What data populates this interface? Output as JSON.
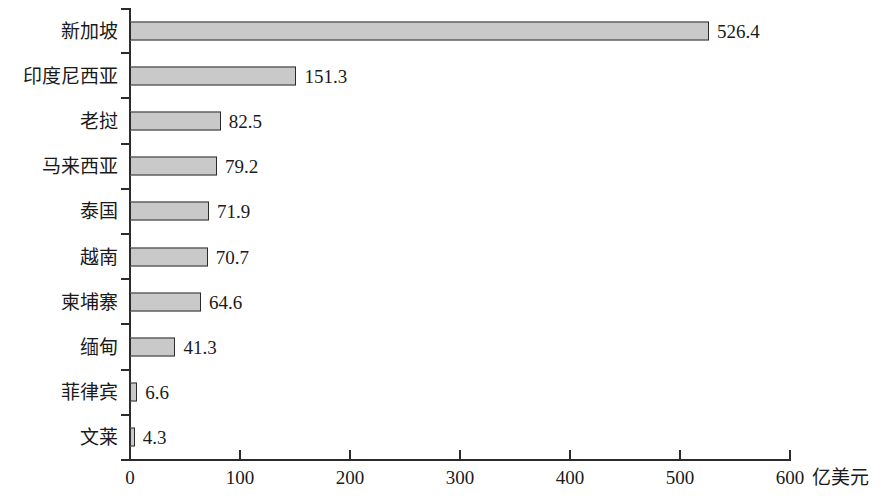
{
  "chart_data": {
    "type": "bar",
    "orientation": "horizontal",
    "title": "",
    "subtitle": "",
    "xlabel": "亿美元",
    "ylabel": "",
    "xlim": [
      0,
      600
    ],
    "xticks": [
      "0",
      "100",
      "200",
      "300",
      "400",
      "500",
      "600"
    ],
    "xtick_values": [
      0,
      100,
      200,
      300,
      400,
      500,
      600
    ],
    "grid": false,
    "legend": false,
    "categories": [
      "新加坡",
      "印度尼西亚",
      "老挝",
      "马来西亚",
      "泰国",
      "越南",
      "柬埔寨",
      "缅甸",
      "菲律宾",
      "文莱"
    ],
    "values": [
      526.4,
      151.3,
      82.5,
      79.2,
      71.9,
      70.7,
      64.6,
      41.3,
      6.6,
      4.3
    ],
    "data_labels": [
      "526.4",
      "151.3",
      "82.5",
      "79.2",
      "71.9",
      "70.7",
      "64.6",
      "41.3",
      "6.6",
      "4.3"
    ],
    "bars": [
      {
        "category": "新加坡",
        "value": 526.4,
        "label": "526.4"
      },
      {
        "category": "印度尼西亚",
        "value": 151.3,
        "label": "151.3"
      },
      {
        "category": "老挝",
        "value": 82.5,
        "label": "82.5"
      },
      {
        "category": "马来西亚",
        "value": 79.2,
        "label": "79.2"
      },
      {
        "category": "泰国",
        "value": 71.9,
        "label": "71.9"
      },
      {
        "category": "越南",
        "value": 70.7,
        "label": "70.7"
      },
      {
        "category": "柬埔寨",
        "value": 64.6,
        "label": "64.6"
      },
      {
        "category": "缅甸",
        "value": 41.3,
        "label": "41.3"
      },
      {
        "category": "菲律宾",
        "value": 6.6,
        "label": "6.6"
      },
      {
        "category": "文莱",
        "value": 4.3,
        "label": "4.3"
      }
    ],
    "colors": {
      "bar_fill": "#c9c9c9",
      "bar_border": "#2b2b2b",
      "axis": "#2b2b2b",
      "text": "#1a1a1a",
      "background": "#ffffff"
    }
  }
}
